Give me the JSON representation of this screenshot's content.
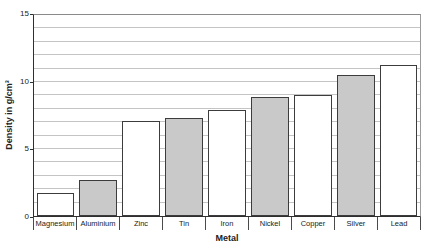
{
  "chart_data": {
    "type": "bar",
    "title": "",
    "xlabel": "Metal",
    "ylabel": "Density in g/cm³",
    "categories": [
      "Magnesium",
      "Aluminium",
      "Zinc",
      "Tin",
      "Iron",
      "Nickel",
      "Copper",
      "Silver",
      "Lead"
    ],
    "values": [
      1.7,
      2.7,
      7.1,
      7.3,
      7.9,
      8.9,
      9.0,
      10.5,
      11.3
    ],
    "bar_colors": [
      "#ffffff",
      "#c9c9c9",
      "#ffffff",
      "#c9c9c9",
      "#ffffff",
      "#c9c9c9",
      "#ffffff",
      "#c9c9c9",
      "#ffffff"
    ],
    "bar_border_color": "#3c3c3c",
    "ylim": [
      0,
      15
    ],
    "yticks": [
      0,
      5,
      10,
      15
    ],
    "grid_interval": 1,
    "grid": true,
    "grid_color": "#c4c4c4",
    "axis_color": "#2f2f2f",
    "legend": false
  }
}
